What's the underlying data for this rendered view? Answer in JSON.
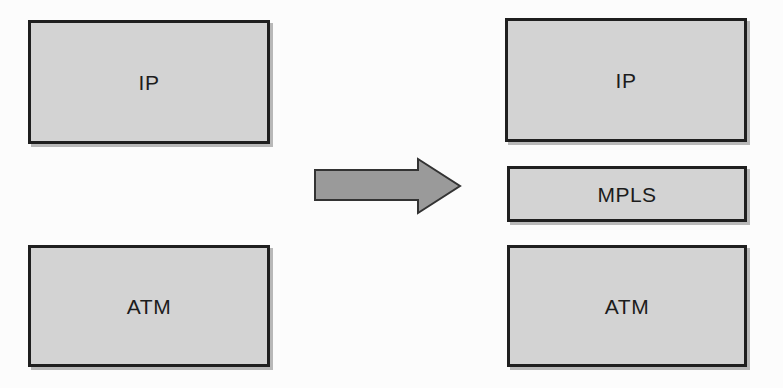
{
  "diagram": {
    "before_stack": {
      "boxes": [
        {
          "label": "IP"
        },
        {
          "label": "ATM"
        }
      ]
    },
    "arrow": {
      "icon": "right-arrow",
      "meaning": "transition"
    },
    "after_stack": {
      "boxes": [
        {
          "label": "IP"
        },
        {
          "label": "MPLS"
        },
        {
          "label": "ATM"
        }
      ]
    }
  },
  "colors": {
    "box_fill": "#d3d3d3",
    "box_border": "#1f1f1f",
    "arrow_fill": "#9a9a9a",
    "arrow_border": "#333333",
    "background": "#fcfcfc",
    "text": "#1c1c1c",
    "shadow": "#b8b8b8"
  }
}
